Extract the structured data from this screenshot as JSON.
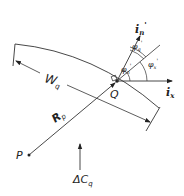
{
  "diagram": {
    "labels": {
      "i_n_prime": "i",
      "i_n_prime_sub": "n",
      "i_n_prime_sup": "'",
      "i_x": "i",
      "i_x_sub": "x",
      "phi_q": "φ",
      "phi_q_sub": "q",
      "phi_q_sup": "'",
      "phi_x": "φ",
      "phi_x_sub": "x",
      "phi_x_sup": "'",
      "phi_n": "φ",
      "phi_n_sub": "n",
      "phi_n_sup": "'",
      "W": "W",
      "W_sub": "q",
      "R": "R",
      "R_sub": "p",
      "Q": "Q",
      "P": "P",
      "dC": "ΔC",
      "dC_sub": "q"
    },
    "colors": {
      "ink": "#222222",
      "background": "#ffffff"
    }
  }
}
